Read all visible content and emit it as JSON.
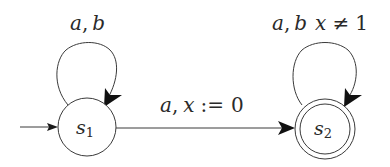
{
  "diagram": {
    "type": "timed-automaton",
    "states": [
      {
        "id": "s1",
        "name": "s",
        "subscript": "1",
        "initial": true,
        "accepting": false
      },
      {
        "id": "s2",
        "name": "s",
        "subscript": "2",
        "initial": false,
        "accepting": true
      }
    ],
    "transitions": [
      {
        "from": "s1",
        "to": "s1",
        "label": "a, b"
      },
      {
        "from": "s1",
        "to": "s2",
        "label": "a, x := 0"
      },
      {
        "from": "s2",
        "to": "s2",
        "label": "a, b x ≠ 1"
      }
    ],
    "labels": {
      "s1_loop_a": "a",
      "s1_loop_comma": ",",
      "s1_loop_b": "b",
      "edge_a": "a",
      "edge_comma": ",",
      "edge_x": "x",
      "edge_assign": ":=",
      "edge_zero": "0",
      "s2_loop_a": "a",
      "s2_loop_comma": ",",
      "s2_loop_b": "b",
      "s2_loop_x": "x",
      "s2_loop_neq": "≠",
      "s2_loop_one": "1"
    },
    "colors": {
      "stroke": "#3a3a3a",
      "text": "#2a2a2a",
      "background": "#ffffff"
    }
  }
}
